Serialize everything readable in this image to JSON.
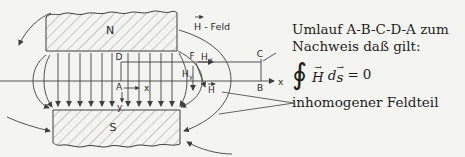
{
  "colors": {
    "background": "#f4f4f1",
    "ink": "#3f3f3f",
    "hatch": "#6f6f6f",
    "text": "#1e1e1e"
  },
  "diagram": {
    "labels": {
      "north_pole": "N",
      "south_pole": "S",
      "point_a": "A",
      "point_b": "B",
      "point_c": "C",
      "point_d": "D",
      "point_f": "F",
      "axis_x_main": "x",
      "axis_x_local": "x",
      "axis_y_local": "y",
      "h_field": "H - Feld",
      "h_symbol_x": "H",
      "h_symbol_y": "H",
      "h_symbol_vec": "H",
      "sub_x": "x",
      "sub_y": "y"
    }
  },
  "caption": {
    "line1": "Umlauf A-B-C-D-A zum",
    "line2": "Nachweis daß gilt:",
    "formula": {
      "integral": "∮",
      "arrow": "→",
      "h": "H",
      "d": "d",
      "s": "s",
      "equals": "=",
      "zero": "0"
    },
    "line4": "inhomogener Feldteil"
  }
}
